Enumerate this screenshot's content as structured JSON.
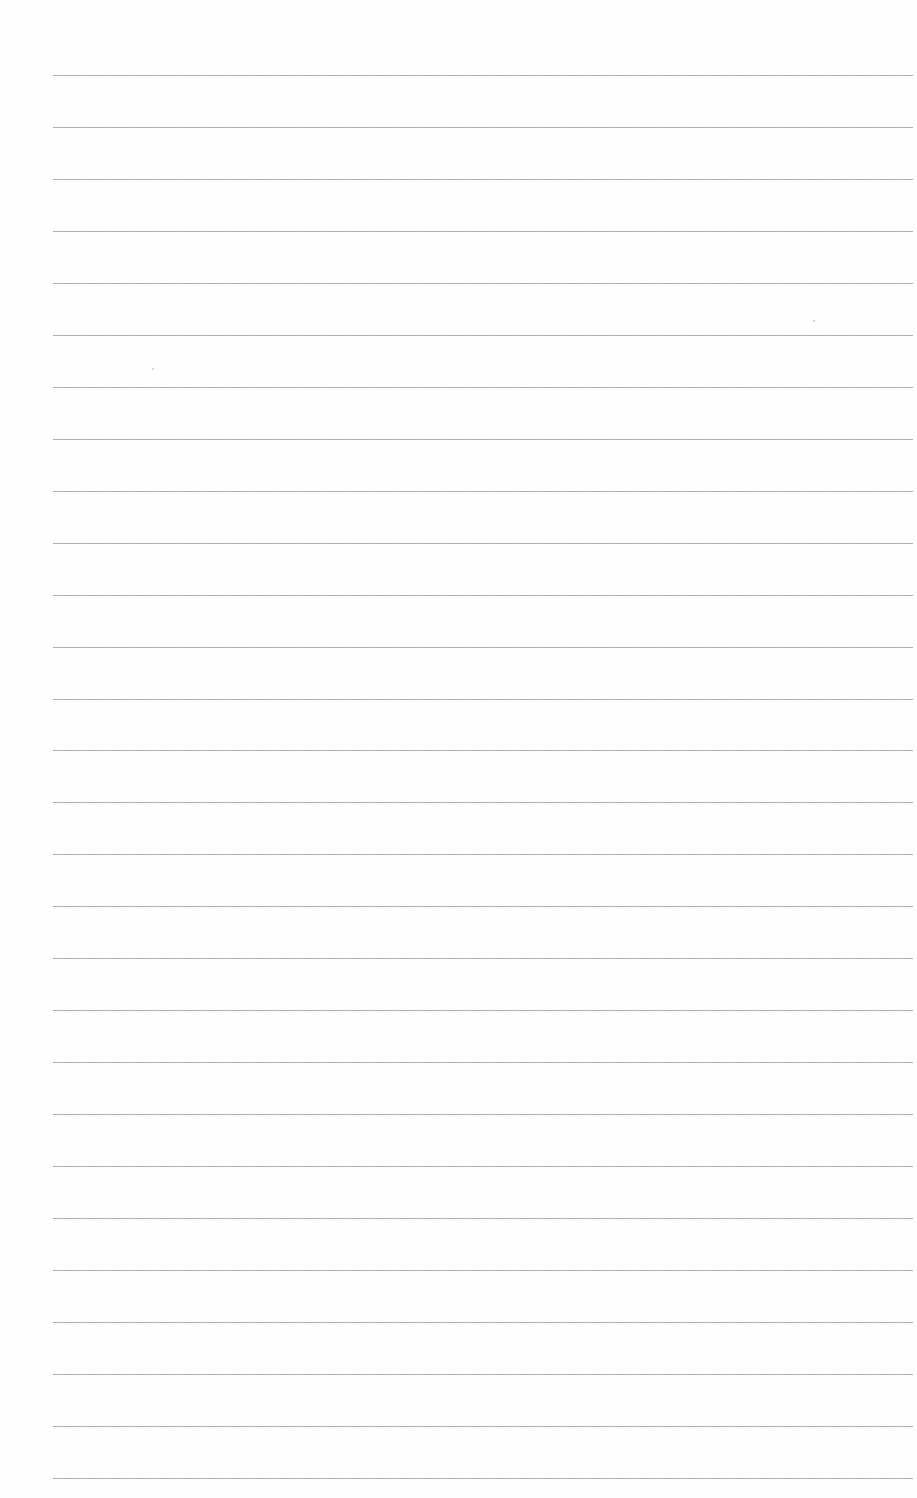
{
  "page": {
    "type": "blank-lined-paper",
    "background_color": "#fefefe",
    "line_color": "#9a9a9a",
    "line_count": 28,
    "line_start_x": 53,
    "line_end_x": 913,
    "first_line_y": 75,
    "line_spacing": 51.96,
    "text": ""
  }
}
